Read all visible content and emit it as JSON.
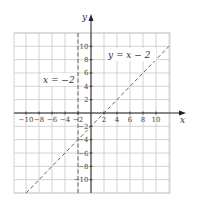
{
  "chart_data": {
    "type": "line",
    "title": "",
    "xlabel": "x",
    "ylabel": "y",
    "xlim": [
      -11,
      12
    ],
    "ylim": [
      -12,
      12
    ],
    "grid": true,
    "grid_step": 2,
    "x_ticks": [
      -10,
      -8,
      -6,
      -4,
      -2,
      2,
      4,
      6,
      8,
      10
    ],
    "y_ticks": [
      10,
      8,
      6,
      4,
      2,
      -2,
      -4,
      -6,
      -8,
      -10
    ],
    "x_tick_labels": [
      "−10",
      "−8",
      "−6",
      "−4",
      "−2",
      "2",
      "4",
      "6",
      "8",
      "10"
    ],
    "y_tick_labels": [
      "10",
      "8",
      "6",
      "4",
      "2",
      "−2",
      "−4",
      "−6",
      "−8",
      "−10"
    ],
    "series": [
      {
        "name": "y = x − 2",
        "kind": "line",
        "style": "dashed",
        "equation": "y = x - 2",
        "x": [
          -10,
          12
        ],
        "y": [
          -12,
          10
        ],
        "label_position": [
          7,
          9
        ]
      },
      {
        "name": "x = −2",
        "kind": "vertical-line",
        "style": "dashed",
        "equation": "x = -2",
        "x": [
          -2,
          -2
        ],
        "y": [
          -12,
          12
        ],
        "label_position": [
          -6,
          5
        ]
      }
    ],
    "annotations": [
      {
        "text": "y = x − 2",
        "x": 7,
        "y": 9
      },
      {
        "text": "x = −2",
        "x": -6,
        "y": 5
      }
    ]
  },
  "labels": {
    "x_axis": "x",
    "y_axis": "y",
    "line1": "y = x − 2",
    "line2": "x = −2"
  },
  "colors": {
    "grid": "#c8c8c8",
    "axis": "#222222",
    "dashed_line": "#666666",
    "text": "#333333"
  }
}
